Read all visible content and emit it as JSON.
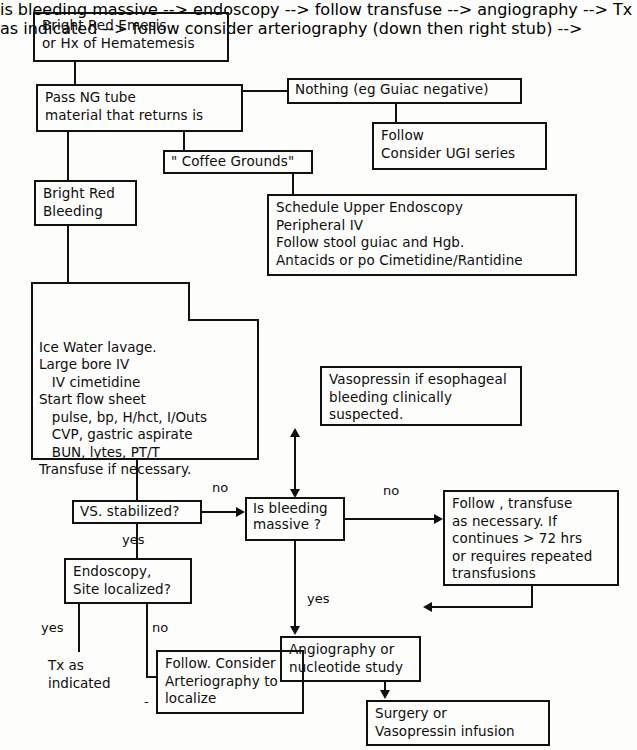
{
  "diagram": {
    "nodes": {
      "emesis": "Bright Red Emesis\nor Hx of Hematemesis",
      "ng_tube": "Pass NG tube\nmaterial that returns is",
      "nothing": "Nothing (eg Guiac negative)",
      "follow_ugi": "Follow\nConsider UGI series",
      "coffee_grounds": "\" Coffee Grounds\"",
      "schedule_endoscopy": "Schedule Upper Endoscopy\nPeripheral IV\nFollow stool guiac and Hgb.\nAntacids or po Cimetidine/Rantidine",
      "bright_red_bleeding": "Bright Red\nBleeding",
      "resuscitation": "Ice Water lavage.\nLarge bore IV\n   IV cimetidine\nStart flow sheet\n   pulse, bp, H/hct, I/Outs\n   CVP, gastric aspirate\n   BUN, lytes, PT/T\nTransfuse if necessary.",
      "vasopressin_esophageal": "Vasopressin if esophageal\nbleeding clinically\nsuspected.",
      "vs_stabilized": "VS. stabilized?",
      "is_bleeding_massive": "Is bleeding\nmassive ?",
      "follow_transfuse": "Follow , transfuse\nas necessary. If\ncontinues > 72 hrs\nor requires repeated\ntransfusions",
      "endoscopy_site": "Endoscopy,\nSite localized?",
      "angiography": "Angiography or\nnucleotide study",
      "follow_arteriography": "Follow. Consider\nArteriography to\nlocalize",
      "surgery": "Surgery or\nVasopressin infusion"
    },
    "free_text": {
      "tx_as_indicated": "Tx as\nindicated",
      "dash": "-"
    },
    "edge_labels": {
      "vs_no": "no",
      "vs_yes": "yes",
      "massive_no": "no",
      "massive_yes": "yes",
      "endoscopy_yes": "yes",
      "endoscopy_no": "no"
    },
    "colors": {
      "ink": "#111111",
      "paper": "#fdfdfb"
    }
  }
}
